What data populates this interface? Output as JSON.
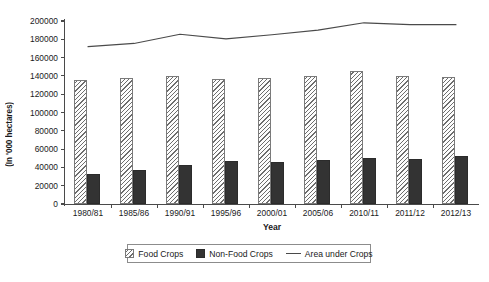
{
  "chart_data": {
    "type": "bar",
    "title": "",
    "xlabel": "Year",
    "ylabel": "(In '000 hectares)",
    "categories": [
      "1980/81",
      "1985/86",
      "1990/91",
      "1995/96",
      "2000/01",
      "2005/06",
      "2010/11",
      "2011/12",
      "2012/13"
    ],
    "ylim": [
      0,
      200000
    ],
    "ytick_step": 20000,
    "yticks": [
      "200000",
      "180000",
      "160000",
      "140000",
      "120000",
      "100000",
      "80000",
      "60000",
      "40000",
      "20000",
      "0"
    ],
    "ytick_values": [
      200000,
      180000,
      160000,
      140000,
      120000,
      100000,
      80000,
      60000,
      40000,
      20000,
      0
    ],
    "grid": false,
    "legend_position": "bottom",
    "series": [
      {
        "name": "Food Crops",
        "type": "bar",
        "values": [
          136000,
          138000,
          139500,
          136500,
          138000,
          140000,
          145000,
          140000,
          139000
        ]
      },
      {
        "name": "Non-Food Crops",
        "type": "bar",
        "values": [
          33000,
          37000,
          43000,
          47500,
          45500,
          48500,
          50000,
          49500,
          53000
        ]
      },
      {
        "name": "Area under Crops",
        "type": "line",
        "values": [
          172000,
          175500,
          185500,
          180500,
          185000,
          190000,
          198000,
          196000,
          196000
        ]
      }
    ]
  },
  "legend": {
    "items": [
      {
        "label": "Food Crops",
        "swatch": "hatched-square-icon"
      },
      {
        "label": "Non-Food Crops",
        "swatch": "filled-square-icon"
      },
      {
        "label": "Area under Crops",
        "swatch": "line-segment-icon"
      }
    ]
  },
  "caption": ""
}
